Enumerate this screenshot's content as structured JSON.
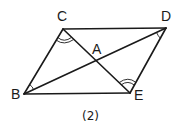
{
  "figure": {
    "caption": "(2)",
    "points": {
      "A": {
        "label": "A",
        "x": 96,
        "y": 61
      },
      "B": {
        "label": "B",
        "x": 24,
        "y": 94
      },
      "C": {
        "label": "C",
        "x": 63,
        "y": 29
      },
      "D": {
        "label": "D",
        "x": 166,
        "y": 28
      },
      "E": {
        "label": "E",
        "x": 130,
        "y": 93
      }
    },
    "segments": [
      "CD",
      "BE",
      "BC",
      "DE",
      "BD",
      "CE"
    ],
    "angle_marks": [
      {
        "vertex": "C",
        "arcs": 2
      },
      {
        "vertex": "E",
        "arcs": 2
      },
      {
        "vertex": "B",
        "arcs": 1
      },
      {
        "vertex": "D",
        "arcs": 1
      }
    ],
    "stroke_color": "#1a1a1a"
  }
}
